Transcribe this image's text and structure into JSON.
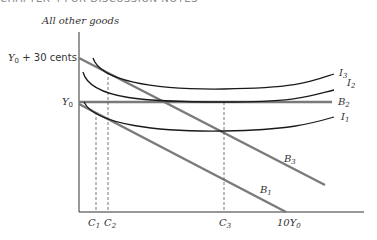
{
  "header": {
    "text": "CHAPTER 4 FOR DISCUSSION NOTES"
  },
  "diagram": {
    "y_axis_label": "All other goods",
    "y_ticks": [
      {
        "label_main": "Y",
        "label_sub": "0",
        "label_suffix": " + 30 cents"
      },
      {
        "label_main": "Y",
        "label_sub": "0",
        "label_suffix": ""
      }
    ],
    "x_ticks": [
      {
        "main": "C",
        "sub": "1"
      },
      {
        "main": "C",
        "sub": "2"
      },
      {
        "main": "C",
        "sub": "3"
      },
      {
        "main": "10Y",
        "sub": "0"
      }
    ],
    "budget_lines": [
      {
        "main": "B",
        "sub": "1"
      },
      {
        "main": "B",
        "sub": "2"
      },
      {
        "main": "B",
        "sub": "3"
      }
    ],
    "indifference_curves": [
      {
        "main": "I",
        "sub": "1"
      },
      {
        "main": "I",
        "sub": "2"
      },
      {
        "main": "I",
        "sub": "3"
      }
    ],
    "colors": {
      "axis": "#333333",
      "budget": "#7a7a7a",
      "curve": "#1a1a1a",
      "guide": "#555555"
    }
  }
}
